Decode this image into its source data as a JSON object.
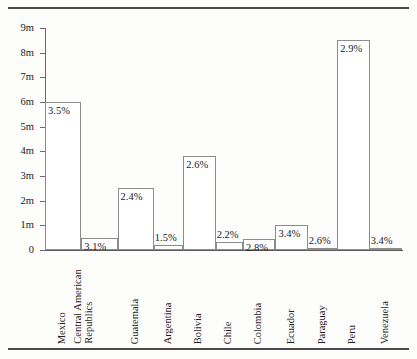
{
  "chart_data": {
    "type": "bar",
    "title": "",
    "subtitle": "",
    "xlabel": "",
    "ylabel": "",
    "ylim": [
      0,
      9
    ],
    "y_unit": "m",
    "grid": false,
    "legend": null,
    "orientation": "vertical",
    "y_ticks": [
      {
        "value": 9,
        "label": "9m"
      },
      {
        "value": 8,
        "label": "8m"
      },
      {
        "value": 7,
        "label": "7m"
      },
      {
        "value": 6,
        "label": "6m"
      },
      {
        "value": 5,
        "label": "5m"
      },
      {
        "value": 4,
        "label": "4m"
      },
      {
        "value": 3,
        "label": "3m"
      },
      {
        "value": 2,
        "label": "2m"
      },
      {
        "value": 1,
        "label": "1m"
      },
      {
        "value": 0,
        "label": "0"
      }
    ],
    "categories": [
      "Mexico",
      "Central American Republics",
      "Guatemala",
      "Argentina",
      "Bolivia",
      "Chile",
      "Colombia",
      "Ecuador",
      "Paraguay",
      "Peru",
      "Venezuela"
    ],
    "values": [
      6.0,
      0.5,
      2.5,
      0.2,
      3.8,
      0.33,
      0.45,
      1.0,
      0.1,
      8.5,
      0.1
    ],
    "data_labels": [
      "3.5%",
      "3.1%",
      "2.4%",
      "1.5%",
      "2.6%",
      "2.2%",
      "2.8%",
      "3.4%",
      "2.6%",
      "2.9%",
      "3.4%"
    ],
    "bars": [
      {
        "category": "Mexico",
        "label_line1": "Mexico",
        "label_line2": "",
        "value": 6.0,
        "pct": "3.5%",
        "pct_inside": true
      },
      {
        "category": "Central American Republics",
        "label_line1": "Central American",
        "label_line2": "Republics",
        "value": 0.5,
        "pct": "3.1%",
        "pct_inside": true
      },
      {
        "category": "Guatemala",
        "label_line1": "Guatemala",
        "label_line2": "",
        "value": 2.5,
        "pct": "2.4%",
        "pct_inside": true
      },
      {
        "category": "Argentina",
        "label_line1": "Argentina",
        "label_line2": "",
        "value": 0.2,
        "pct": "1.5%",
        "pct_inside": false
      },
      {
        "category": "Bolivia",
        "label_line1": "Bolivia",
        "label_line2": "",
        "value": 3.8,
        "pct": "2.6%",
        "pct_inside": true
      },
      {
        "category": "Chile",
        "label_line1": "Chile",
        "label_line2": "",
        "value": 0.33,
        "pct": "2.2%",
        "pct_inside": false
      },
      {
        "category": "Colombia",
        "label_line1": "Colombia",
        "label_line2": "",
        "value": 0.45,
        "pct": "2.8%",
        "pct_inside": true
      },
      {
        "category": "Ecuador",
        "label_line1": "Ecuador",
        "label_line2": "",
        "value": 1.0,
        "pct": "3.4%",
        "pct_inside": true
      },
      {
        "category": "Paraguay",
        "label_line1": "Paraguay",
        "label_line2": "",
        "value": 0.1,
        "pct": "2.6%",
        "pct_inside": false
      },
      {
        "category": "Peru",
        "label_line1": "Peru",
        "label_line2": "",
        "value": 8.5,
        "pct": "2.9%",
        "pct_inside": true
      },
      {
        "category": "Venezuela",
        "label_line1": "Venezuela",
        "label_line2": "",
        "value": 0.1,
        "pct": "3.4%",
        "pct_inside": false
      }
    ],
    "colors": {
      "background": "#fdfdfc",
      "bar_fill": "#ffffff",
      "bar_edge": "#8c8c8c",
      "axis": "#6b6b6b",
      "text": "#1d1d1d",
      "rule": "#4a4a4a"
    }
  }
}
